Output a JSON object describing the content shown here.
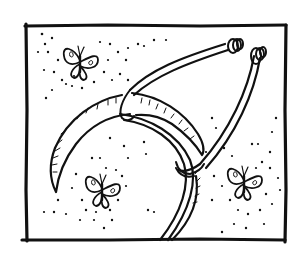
{
  "illustration": {
    "style": "black ink hand-drawn",
    "background": "#ffffff",
    "ink_color": "#111111",
    "frame": {
      "x": 26,
      "y": 25,
      "width": 259,
      "height": 215
    },
    "subjects": [
      {
        "id": "instrument",
        "description": "curved forceps-like instrument with two arms ending in rolled tips, looped over a crescent blade"
      },
      {
        "id": "butterfly-top-left",
        "description": "butterfly with spiral-patterned wings",
        "cx": 82,
        "cy": 62
      },
      {
        "id": "butterfly-bottom-left",
        "description": "butterfly with spiral-patterned wings",
        "cx": 102,
        "cy": 190
      },
      {
        "id": "butterfly-right",
        "description": "butterfly with spiral-patterned wings",
        "cx": 244,
        "cy": 183
      }
    ]
  }
}
